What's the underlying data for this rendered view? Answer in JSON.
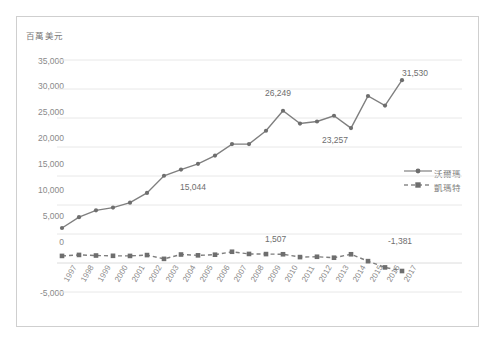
{
  "figure": {
    "axis_title": "百萬美元",
    "border_color": "#cfcfcf",
    "background": "#ffffff"
  },
  "legend": {
    "position": "right-middle",
    "entries": [
      {
        "label": "沃爾瑪",
        "style": "solid-line-with-markers",
        "color": "#7f7f7f"
      },
      {
        "label": "凱瑪特",
        "style": "dashed-line-with-square-markers",
        "color": "#7f7f7f"
      }
    ]
  },
  "chart_data": {
    "type": "line",
    "title": "",
    "subtitle": "",
    "xlabel": "",
    "ylabel": "百萬美元",
    "ylim": [
      -5000,
      35000
    ],
    "ytick_labels": [
      "35,000",
      "30,000",
      "25,000",
      "20,000",
      "15,000",
      "10,000",
      "5,000",
      "0",
      "-5,000"
    ],
    "ytick_values": [
      35000,
      30000,
      25000,
      20000,
      15000,
      10000,
      5000,
      0,
      -5000
    ],
    "grid": true,
    "grid_axis": "y",
    "legend_position": "right",
    "categories": [
      "1997",
      "1998",
      "1999",
      "2000",
      "2001",
      "2002",
      "2003",
      "2004",
      "2005",
      "2006",
      "2007",
      "2008",
      "2009",
      "2010",
      "2011",
      "2012",
      "2013",
      "2014",
      "2015",
      "2016",
      "2017"
    ],
    "series": [
      {
        "name": "沃爾瑪",
        "color": "#7f7f7f",
        "line_style": "solid",
        "marker": "circle",
        "values": [
          6034,
          7896,
          9083,
          9554,
          10399,
          12077,
          15044,
          16105,
          17091,
          18530,
          20497,
          20497,
          22798,
          26249,
          24047,
          24398,
          25389,
          23257,
          28797,
          27147,
          31530
        ]
      },
      {
        "name": "凱瑪特",
        "color": "#7f7f7f",
        "line_style": "dashed",
        "marker": "square",
        "values": [
          1222,
          1392,
          1290,
          1240,
          1220,
          1368,
          715,
          1464,
          1320,
          1430,
          1940,
          1562,
          1538,
          1507,
          1020,
          1075,
          912,
          1507,
          320,
          -760,
          -1381
        ]
      }
    ],
    "annotations": [
      {
        "text": "15,044",
        "series": "沃爾瑪",
        "category": "2003",
        "value": 15044
      },
      {
        "text": "26,249",
        "series": "沃爾瑪",
        "category": "2010",
        "value": 26249
      },
      {
        "text": "23,257",
        "series": "沃爾瑪",
        "category": "2014",
        "value": 23257
      },
      {
        "text": "31,530",
        "series": "沃爾瑪",
        "category": "2017",
        "value": 31530
      },
      {
        "text": "1,507",
        "series": "凱瑪特",
        "category": "2011",
        "value": 1507
      },
      {
        "text": "-1,381",
        "series": "凱瑪特",
        "category": "2017",
        "value": -1381
      }
    ]
  }
}
